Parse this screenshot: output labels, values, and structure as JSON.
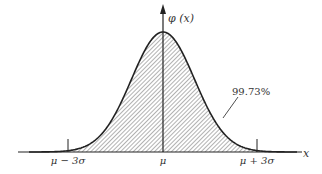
{
  "figure": {
    "y_axis_label": "φ (x)",
    "x_axis_label": "x",
    "area_label": "99.73%",
    "ticks": [
      {
        "label": "μ − 3σ",
        "x": 68
      },
      {
        "label": "μ",
        "x": 163
      },
      {
        "label": "μ + 3σ",
        "x": 257
      }
    ]
  },
  "chart_data": {
    "type": "area",
    "title": "",
    "xlabel": "x",
    "ylabel": "φ(x)",
    "distribution": "normal",
    "shaded_interval": [
      "μ − 3σ",
      "μ + 3σ"
    ],
    "shaded_probability": "99.73%",
    "tick_labels": [
      "μ − 3σ",
      "μ",
      "μ + 3σ"
    ],
    "grid": false,
    "legend": "none"
  }
}
